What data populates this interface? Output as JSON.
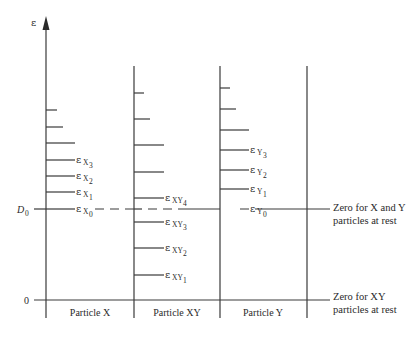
{
  "diagram": {
    "axis": {
      "symbol": "ε",
      "d0_label": "D",
      "d0_sub": "0",
      "zero_label": "0"
    },
    "columns": [
      {
        "name": "Particle X"
      },
      {
        "name": "Particle XY"
      },
      {
        "name": "Particle Y"
      }
    ],
    "particle_x": {
      "labels": [
        {
          "main": "ε",
          "sub1": "X",
          "sub2": "0"
        },
        {
          "main": "ε",
          "sub1": "X",
          "sub2": "1"
        },
        {
          "main": "ε",
          "sub1": "X",
          "sub2": "2"
        },
        {
          "main": "ε",
          "sub1": "X",
          "sub2": "3"
        }
      ]
    },
    "particle_xy": {
      "labels": [
        {
          "main": "ε",
          "sub1": "XY",
          "sub2": "1"
        },
        {
          "main": "ε",
          "sub1": "XY",
          "sub2": "2"
        },
        {
          "main": "ε",
          "sub1": "XY",
          "sub2": "3"
        },
        {
          "main": "ε",
          "sub1": "XY",
          "sub2": "4"
        }
      ]
    },
    "particle_y": {
      "labels": [
        {
          "main": "ε",
          "sub1": "Y",
          "sub2": "0"
        },
        {
          "main": "ε",
          "sub1": "Y",
          "sub2": "1"
        },
        {
          "main": "ε",
          "sub1": "Y",
          "sub2": "2"
        },
        {
          "main": "ε",
          "sub1": "Y",
          "sub2": "3"
        }
      ]
    },
    "notes": {
      "xy_rest_line1": "Zero for X and Y",
      "xy_rest_line2": "particles at rest",
      "zero_line1": "Zero for XY",
      "zero_line2": "particles at rest"
    }
  }
}
